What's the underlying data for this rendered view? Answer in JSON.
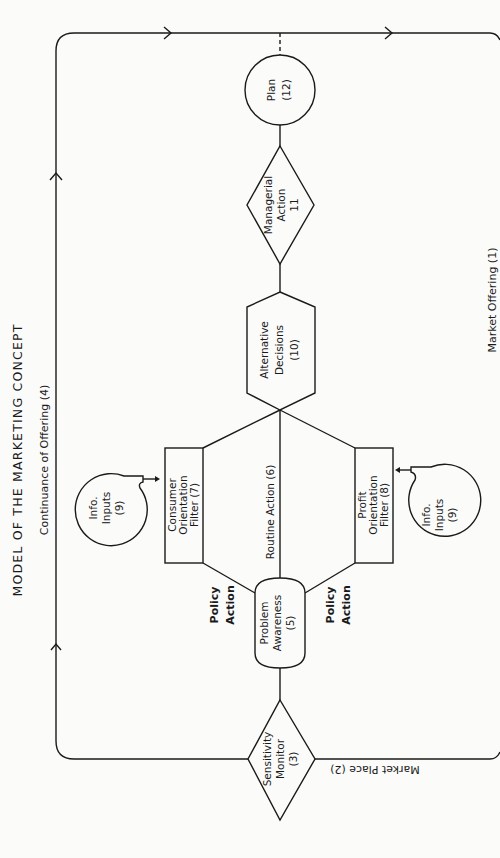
{
  "title": "MODEL OF THE MARKETING CONCEPT",
  "loop_labels": {
    "continuance": "Continuance of Offering (4)",
    "market_offering": "Market Offering (1)",
    "market_place": "Market Place (2)"
  },
  "nodes": {
    "plan": {
      "line1": "Plan",
      "line2": "(12)"
    },
    "managerial_action": {
      "line1": "Managerial",
      "line2": "Action",
      "line3": "11"
    },
    "alternative_decisions": {
      "line1": "Alternative",
      "line2": "Decisions",
      "line3": "(10)"
    },
    "consumer_filter": {
      "line1": "Consumer",
      "line2": "Orientation",
      "line3": "Filter (7)"
    },
    "profit_filter": {
      "line1": "Profit",
      "line2": "Orientation",
      "line3": "Filter (8)"
    },
    "problem_awareness": {
      "line1": "Problem",
      "line2": "Awareness",
      "line3": "(5)"
    },
    "sensitivity_monitor": {
      "line1": "Sensitivity",
      "line2": "Monitor",
      "line3": "(3)"
    },
    "info_inputs_left": {
      "line1": "Info.",
      "line2": "Inputs",
      "line3": "(9)"
    },
    "info_inputs_right": {
      "line1": "Info.",
      "line2": "Inputs",
      "line3": "(9)"
    }
  },
  "edge_labels": {
    "routine_action": "Routine Action (6)",
    "policy_action_left": {
      "line1": "Policy",
      "line2": "Action"
    },
    "policy_action_right": {
      "line1": "Policy",
      "line2": "Action"
    }
  }
}
